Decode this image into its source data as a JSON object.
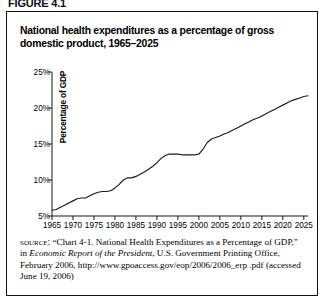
{
  "figure": {
    "label": "FIGURE 4.1"
  },
  "chart_title": "National health expenditures as a percentage of gross domestic product, 1965–2025",
  "source": {
    "lead": "source:",
    "part1": " “Chart 4-1. National Health Expenditures as a Percentage of GDP,” in ",
    "italic": "Economic Report of the President",
    "part2": ", U.S. Government Printing Office, February 2006, http://www.gpoaccess.gov/eop/2006/2006_erp .pdf (accessed June 19, 2006)"
  },
  "chart_data": {
    "type": "line",
    "title": "National health expenditures as a percentage of gross domestic product, 1965–2025",
    "xlabel": "",
    "ylabel": "Percentage of GDP",
    "xlim": [
      1965,
      2026
    ],
    "ylim": [
      5,
      25
    ],
    "grid": false,
    "legend": "none",
    "line_color": "#1a1a1a",
    "xticks": [
      1965,
      1970,
      1975,
      1980,
      1985,
      1990,
      1995,
      2000,
      2005,
      2010,
      2015,
      2020,
      2025
    ],
    "xtick_labels": [
      "1965",
      "1970",
      "1975",
      "1980",
      "1985",
      "1990",
      "1995",
      "2000",
      "2005",
      "2010",
      "2015",
      "2020",
      "2025"
    ],
    "yticks": [
      5,
      10,
      15,
      20,
      25
    ],
    "ytick_labels": [
      "5%",
      "10%",
      "15%",
      "20%",
      "25%"
    ],
    "series": [
      {
        "name": "National health expenditures (% of GDP)",
        "x": [
          1965,
          1966,
          1967,
          1968,
          1969,
          1970,
          1971,
          1972,
          1973,
          1974,
          1975,
          1976,
          1977,
          1978,
          1979,
          1980,
          1981,
          1982,
          1983,
          1984,
          1985,
          1986,
          1987,
          1988,
          1989,
          1990,
          1991,
          1992,
          1993,
          1994,
          1995,
          1996,
          1997,
          1998,
          1999,
          2000,
          2001,
          2002,
          2003,
          2004,
          2005,
          2006,
          2007,
          2008,
          2009,
          2010,
          2011,
          2012,
          2013,
          2014,
          2015,
          2016,
          2017,
          2018,
          2019,
          2020,
          2021,
          2022,
          2023,
          2024,
          2025,
          2026
        ],
        "values": [
          5.8,
          5.9,
          6.2,
          6.5,
          6.8,
          7.1,
          7.4,
          7.5,
          7.5,
          7.8,
          8.1,
          8.3,
          8.4,
          8.4,
          8.5,
          8.9,
          9.4,
          10.0,
          10.3,
          10.3,
          10.5,
          10.8,
          11.1,
          11.5,
          11.9,
          12.4,
          13.0,
          13.4,
          13.6,
          13.6,
          13.6,
          13.5,
          13.5,
          13.5,
          13.5,
          13.6,
          14.3,
          15.2,
          15.7,
          15.9,
          16.1,
          16.4,
          16.6,
          16.9,
          17.2,
          17.5,
          17.8,
          18.1,
          18.4,
          18.6,
          18.9,
          19.2,
          19.5,
          19.8,
          20.1,
          20.4,
          20.7,
          21.0,
          21.2,
          21.4,
          21.6,
          21.7
        ]
      }
    ]
  }
}
